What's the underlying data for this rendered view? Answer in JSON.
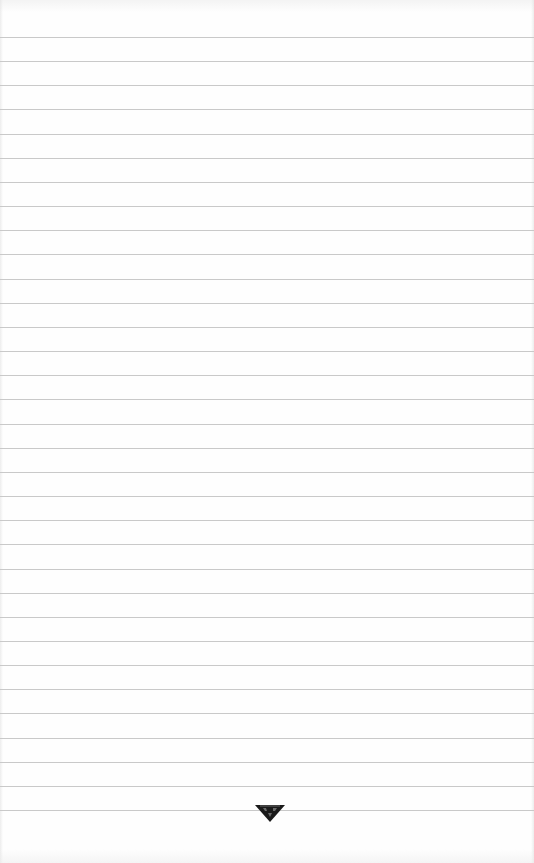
{
  "page": {
    "type": "lined-notepad-sheet",
    "background_color": "#fefefe",
    "line_color": "#c9c9c9",
    "line_count": 33,
    "first_line_y": 37,
    "line_spacing": 24.16,
    "content_text": ""
  },
  "footer": {
    "logo_icon": "inverted-triangle-logo-icon",
    "logo_color": "#1a1a1a"
  }
}
